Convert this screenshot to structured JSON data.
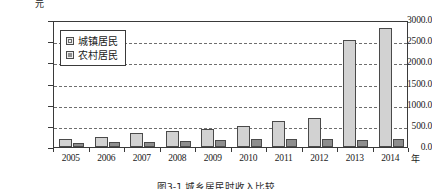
{
  "chart_data": {
    "type": "bar",
    "title": "",
    "caption": "图3-1 城乡居民时收入比较",
    "xlabel": "年",
    "ylabel": "元",
    "ylim": [
      0,
      3000
    ],
    "yticks": [
      0,
      500,
      1000,
      1500,
      2000,
      2500,
      3000
    ],
    "ytick_labels": [
      "0.0",
      "500.0",
      "1000.0",
      "1500.0",
      "2000.0",
      "2500.0",
      "3000.0"
    ],
    "grid": true,
    "legend_position": "upper-left-inside",
    "categories": [
      "2005",
      "2006",
      "2007",
      "2008",
      "2009",
      "2010",
      "2011",
      "2012",
      "2013",
      "2014"
    ],
    "series": [
      {
        "name": "城镇居民",
        "color": "#d2d2d2",
        "values": [
          180,
          240,
          340,
          385,
          420,
          505,
          620,
          680,
          2530,
          2820
        ]
      },
      {
        "name": "农村居民",
        "color": "#8e8e8e",
        "values": [
          95,
          110,
          130,
          150,
          165,
          180,
          190,
          200,
          165,
          180
        ]
      }
    ]
  }
}
